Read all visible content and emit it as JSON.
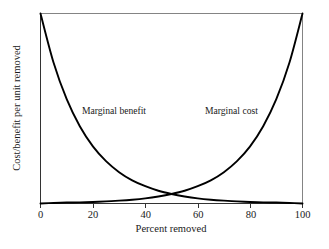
{
  "chart_data": {
    "type": "line",
    "title": "",
    "xlabel": "Percent removed",
    "ylabel": "Cost/benefit per unit removed",
    "xlim": [
      0,
      100
    ],
    "ylim": [
      0,
      1
    ],
    "xticks": [
      "0",
      "20",
      "40",
      "60",
      "80",
      "100"
    ],
    "xtick_values": [
      0,
      20,
      40,
      60,
      80,
      100
    ],
    "yticks": [],
    "grid": false,
    "legend": "inline-labels",
    "x": [
      0,
      5,
      10,
      15,
      20,
      25,
      30,
      35,
      40,
      45,
      50,
      55,
      60,
      65,
      70,
      75,
      80,
      85,
      90,
      95,
      100
    ],
    "series": [
      {
        "name": "Marginal benefit",
        "label": "Marginal benefit",
        "color": "#000000",
        "values": [
          1.0,
          0.741,
          0.549,
          0.407,
          0.301,
          0.223,
          0.165,
          0.122,
          0.091,
          0.067,
          0.05,
          0.037,
          0.027,
          0.02,
          0.015,
          0.011,
          0.008,
          0.006,
          0.005,
          0.003,
          0.0
        ]
      },
      {
        "name": "Marginal cost",
        "label": "Marginal cost",
        "color": "#000000",
        "values": [
          0.0,
          0.003,
          0.005,
          0.006,
          0.008,
          0.011,
          0.015,
          0.02,
          0.027,
          0.037,
          0.05,
          0.067,
          0.091,
          0.122,
          0.165,
          0.223,
          0.301,
          0.407,
          0.549,
          0.741,
          1.0
        ]
      }
    ],
    "annotations": [
      {
        "text": "Marginal benefit",
        "x": 18,
        "y": 0.49
      },
      {
        "text": "Marginal cost",
        "x": 63,
        "y": 0.49
      }
    ],
    "intersection": {
      "x": 50,
      "y": 0.05
    }
  },
  "labels": {
    "marginal_benefit": "Marginal benefit",
    "marginal_cost": "Marginal cost",
    "x_axis_title": "Percent removed",
    "y_axis_title": "Cost/benefit per unit removed",
    "tick_0": "0",
    "tick_20": "20",
    "tick_40": "40",
    "tick_60": "60",
    "tick_80": "80",
    "tick_100": "100"
  }
}
